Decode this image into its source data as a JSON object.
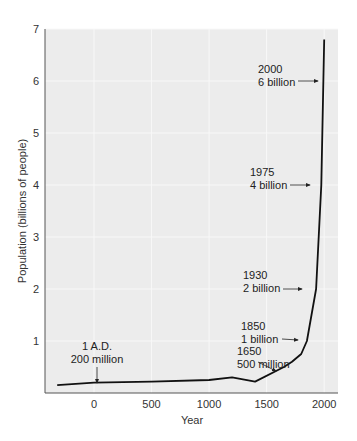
{
  "chart_data": {
    "type": "line",
    "title": "",
    "xlabel": "Year",
    "ylabel": "Population (billions of people)",
    "xlim": [
      -450,
      2100
    ],
    "ylim": [
      0,
      7
    ],
    "x_ticks": [
      "0",
      "500",
      "1000",
      "1500",
      "2000"
    ],
    "y_ticks": [
      "1",
      "2",
      "3",
      "4",
      "5",
      "6",
      "7"
    ],
    "grid": true,
    "series": [
      {
        "name": "World population",
        "x": [
          -320,
          0,
          500,
          1000,
          1200,
          1400,
          1650,
          1720,
          1800,
          1850,
          1930,
          1975,
          2000
        ],
        "values": [
          0.15,
          0.2,
          0.22,
          0.25,
          0.3,
          0.22,
          0.5,
          0.6,
          0.75,
          1.0,
          2.0,
          4.0,
          6.8
        ]
      }
    ],
    "annotations": [
      {
        "line1": "1 A.D.",
        "line2": "200 million",
        "x": 1,
        "y": 0.2
      },
      {
        "line1": "1650",
        "line2": "500 million",
        "x": 1650,
        "y": 0.5
      },
      {
        "line1": "1850",
        "line2": "1 billion",
        "x": 1850,
        "y": 1.0
      },
      {
        "line1": "1930",
        "line2": "2 billion",
        "x": 1930,
        "y": 2.0
      },
      {
        "line1": "1975",
        "line2": "4 billion",
        "x": 1975,
        "y": 4.0
      },
      {
        "line1": "2000",
        "line2": "6 billion",
        "x": 2000,
        "y": 6.0
      }
    ]
  }
}
